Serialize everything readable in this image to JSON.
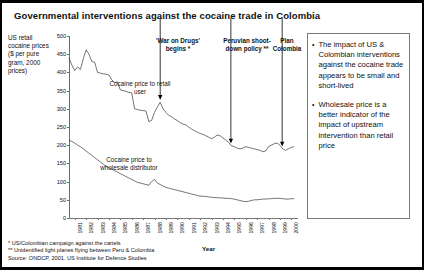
{
  "title": "Governmental interventions against the cocaine trade in Colombia",
  "axis": {
    "ylabel": "US retail cocaine prices ($ per pure gram, 2000 prices)",
    "xlabel": "Year"
  },
  "series_labels": {
    "retail": "Cocaine price to retail user",
    "wholesale": "Cocaine price to wholesale distributor"
  },
  "annotations": [
    {
      "id": "war-on-drugs",
      "text": "'War on Drugs' begins *"
    },
    {
      "id": "peruvian-shootdown",
      "text": "Peruvian shoot-down policy **"
    },
    {
      "id": "plan-colombia",
      "text": "Plan Colombia"
    }
  ],
  "panel": {
    "bullet_char": "•",
    "bullets": [
      "The impact of US & Colombian interventions against the cocaine trade appears to be small and short-lived",
      "Wholesale price is a better indicator of the impact of upstream intervention than retail price"
    ]
  },
  "notes": {
    "note1": "* US/Colombian campaign against the cartels",
    "note2": "** Unidentified light planes flying between Peru & Colombia",
    "source": "Source: ONDCP, 2001. US Institute for Defence Studies"
  },
  "chart_data": {
    "type": "line",
    "title": "Governmental interventions against the cocaine trade in Colombia",
    "xlabel": "Year",
    "ylabel": "US retail cocaine prices ($ per pure gram, 2000 prices)",
    "ylim": [
      0,
      500
    ],
    "yticks": [
      0,
      50,
      100,
      150,
      200,
      250,
      300,
      350,
      400,
      450,
      500
    ],
    "xlim": [
      1981,
      2001
    ],
    "xticks": [
      1981,
      1982,
      1983,
      1984,
      1985,
      1986,
      1987,
      1988,
      1989,
      1990,
      1991,
      1992,
      1993,
      1994,
      1995,
      1996,
      1997,
      1998,
      1999,
      2000
    ],
    "grid": false,
    "legend": "inline-labels",
    "annotations": [
      {
        "label": "'War on Drugs' begins *",
        "x": 1989.0,
        "points_to_series": "retail"
      },
      {
        "label": "Peruvian shoot-down policy **",
        "x": 1995.2,
        "points_to_series": "retail"
      },
      {
        "label": "Plan Colombia",
        "x": 1999.7,
        "points_to_series": "retail"
      }
    ],
    "x": [
      1981.0,
      1981.25,
      1981.5,
      1981.75,
      1982.0,
      1982.25,
      1982.5,
      1982.75,
      1983.0,
      1983.25,
      1983.5,
      1983.75,
      1984.0,
      1984.25,
      1984.5,
      1984.75,
      1985.0,
      1985.25,
      1985.5,
      1985.75,
      1986.0,
      1986.25,
      1986.5,
      1986.75,
      1987.0,
      1987.25,
      1987.5,
      1987.75,
      1988.0,
      1988.25,
      1988.5,
      1988.75,
      1989.0,
      1989.25,
      1989.5,
      1989.75,
      1990.0,
      1990.25,
      1990.5,
      1990.75,
      1991.0,
      1991.25,
      1991.5,
      1991.75,
      1992.0,
      1992.25,
      1992.5,
      1992.75,
      1993.0,
      1993.25,
      1993.5,
      1993.75,
      1994.0,
      1994.25,
      1994.5,
      1994.75,
      1995.0,
      1995.25,
      1995.5,
      1995.75,
      1996.0,
      1996.25,
      1996.5,
      1996.75,
      1997.0,
      1997.25,
      1997.5,
      1997.75,
      1998.0,
      1998.25,
      1998.5,
      1998.75,
      1999.0,
      1999.25,
      1999.5,
      1999.75,
      2000.0,
      2000.25,
      2000.5,
      2000.75
    ],
    "series": [
      {
        "name": "Cocaine price to retail user",
        "values": [
          440,
          420,
          405,
          415,
          408,
          437,
          462,
          450,
          430,
          428,
          400,
          398,
          396,
          395,
          393,
          380,
          372,
          374,
          352,
          350,
          348,
          345,
          344,
          300,
          298,
          296,
          295,
          294,
          265,
          268,
          290,
          305,
          318,
          300,
          290,
          282,
          278,
          272,
          268,
          262,
          258,
          256,
          250,
          244,
          240,
          236,
          232,
          230,
          226,
          222,
          218,
          222,
          228,
          226,
          220,
          214,
          208,
          198,
          196,
          192,
          190,
          192,
          196,
          194,
          192,
          190,
          188,
          186,
          182,
          184,
          196,
          200,
          204,
          206,
          200,
          190,
          186,
          190,
          194,
          196
        ]
      },
      {
        "name": "Cocaine price to wholesale distributor",
        "values": [
          214,
          210,
          206,
          200,
          196,
          190,
          184,
          178,
          172,
          166,
          160,
          154,
          148,
          142,
          138,
          134,
          130,
          126,
          122,
          118,
          114,
          110,
          106,
          102,
          98,
          96,
          94,
          92,
          90,
          100,
          106,
          96,
          92,
          88,
          84,
          82,
          80,
          78,
          76,
          74,
          72,
          70,
          68,
          66,
          64,
          62,
          60,
          60,
          59,
          58,
          57,
          56,
          56,
          55,
          55,
          54,
          54,
          53,
          52,
          50,
          48,
          46,
          45,
          46,
          48,
          50,
          50,
          51,
          52,
          52,
          53,
          53,
          54,
          54,
          54,
          53,
          52,
          52,
          53,
          53
        ]
      }
    ]
  }
}
